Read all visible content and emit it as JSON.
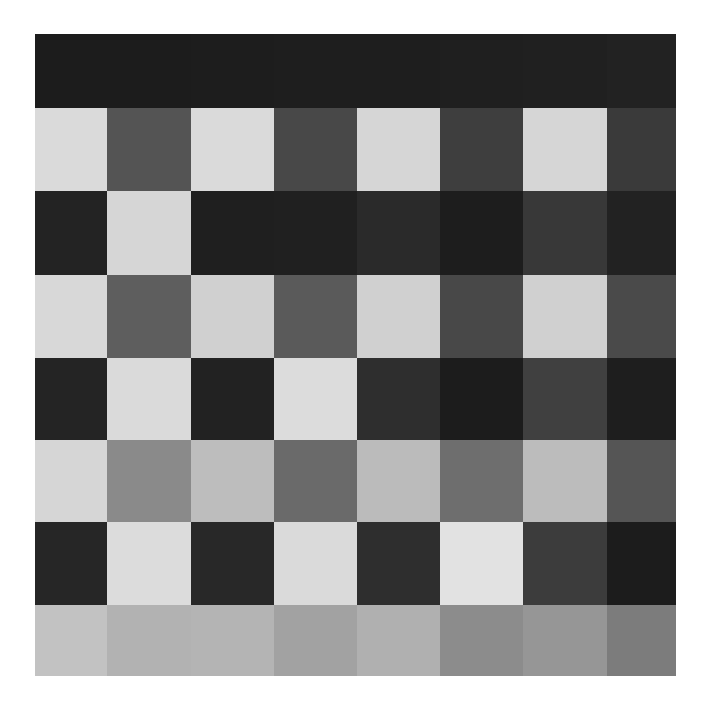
{
  "board": {
    "origin": {
      "x": 35,
      "y": 34
    },
    "rows": 8,
    "cols": 8,
    "col_widths": [
      72,
      84,
      83,
      83,
      83,
      83,
      84,
      69
    ],
    "row_heights": [
      74,
      83,
      84,
      83,
      82,
      82,
      83,
      71
    ],
    "cells": [
      [
        "#1c1c1c",
        "#1c1c1c",
        "#1d1d1d",
        "#1e1e1e",
        "#1e1e1e",
        "#1f1f1f",
        "#202020",
        "#222222"
      ],
      [
        "#dadada",
        "#545454",
        "#dadada",
        "#484848",
        "#d6d6d6",
        "#3e3e3e",
        "#d6d6d6",
        "#3a3a3a"
      ],
      [
        "#232323",
        "#d6d6d6",
        "#1f1f1f",
        "#202020",
        "#2a2a2a",
        "#1d1d1d",
        "#383838",
        "#222222"
      ],
      [
        "#d8d8d8",
        "#5e5e5e",
        "#d0d0d0",
        "#5a5a5a",
        "#d0d0d0",
        "#484848",
        "#d0d0d0",
        "#4a4a4a"
      ],
      [
        "#242424",
        "#dadada",
        "#222222",
        "#dcdcdc",
        "#2e2e2e",
        "#1c1c1c",
        "#404040",
        "#1e1e1e"
      ],
      [
        "#d6d6d6",
        "#8a8a8a",
        "#bdbdbd",
        "#6a6a6a",
        "#bbbbbb",
        "#6e6e6e",
        "#bcbcbc",
        "#555555"
      ],
      [
        "#262626",
        "#dcdcdc",
        "#282828",
        "#dadada",
        "#2e2e2e",
        "#e2e2e2",
        "#3c3c3c",
        "#1c1c1c"
      ],
      [
        "#c2c2c2",
        "#b2b2b2",
        "#b4b4b4",
        "#a2a2a2",
        "#b0b0b0",
        "#8c8c8c",
        "#969696",
        "#7c7c7c"
      ]
    ]
  }
}
